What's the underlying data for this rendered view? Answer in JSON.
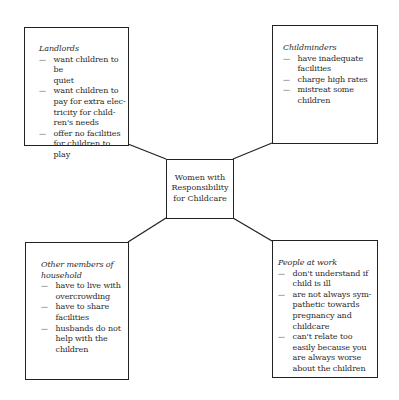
{
  "diagram": {
    "center": {
      "lines": [
        "Women with",
        "Responsibility",
        "for Childcare"
      ]
    },
    "boxes": [
      {
        "id": "landlords",
        "title": "Landlords",
        "title_style": "italic",
        "items": [
          [
            "want children to be",
            "quiet"
          ],
          [
            "want children to",
            "pay for extra elec-",
            "tricity for child-",
            "ren's needs"
          ],
          [
            "offer no facilities",
            "for children to play"
          ]
        ]
      },
      {
        "id": "childminders",
        "title": "Childminders",
        "title_style": "italic",
        "items": [
          [
            "have inadequate",
            "facilities"
          ],
          [
            "charge high rates"
          ],
          [
            "mistreat some",
            "children"
          ]
        ]
      },
      {
        "id": "household",
        "title": "Other members of household",
        "title_lines": [
          "Other members of",
          "household"
        ],
        "title_style": "italic",
        "items": [
          [
            "have to live with",
            "overcrowding"
          ],
          [
            "have to share",
            "facilities"
          ],
          [
            "husbands do not",
            "help with the",
            "children"
          ]
        ]
      },
      {
        "id": "work",
        "title": "People at work",
        "title_style": "italic",
        "items": [
          [
            "don't understand if",
            "child is ill"
          ],
          [
            "are not always sym-",
            "pathetic towards",
            "pregnancy and",
            "childcare"
          ],
          [
            "can't relate too",
            "easily because you",
            "are always worse",
            "about the children"
          ]
        ]
      }
    ],
    "colors": {
      "line": "#222222",
      "text": "#2a2a2a",
      "background": "#ffffff"
    }
  }
}
